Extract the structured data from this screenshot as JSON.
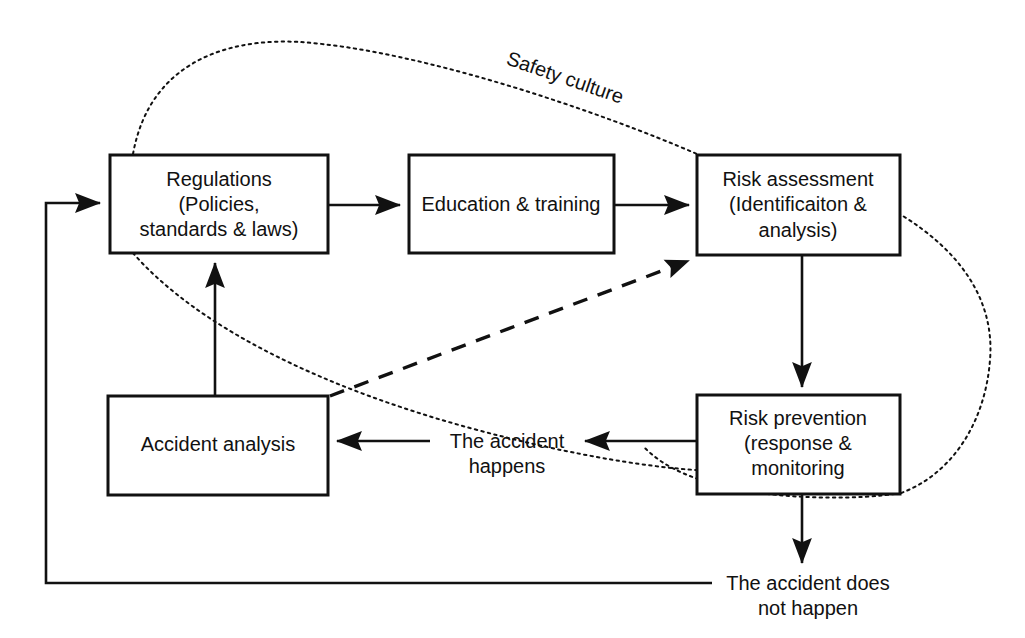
{
  "diagram": {
    "colors": {
      "stroke": "#111111",
      "background": "#ffffff"
    },
    "nodes": [
      {
        "id": "regulations",
        "lines": [
          "Regulations",
          "(Policies,",
          "standards & laws)"
        ]
      },
      {
        "id": "education",
        "lines": [
          "Education & training"
        ]
      },
      {
        "id": "risk-assessment",
        "lines": [
          "Risk assessment",
          "(Identificaiton &",
          "analysis)"
        ]
      },
      {
        "id": "risk-prevention",
        "lines": [
          "Risk prevention",
          "(response &",
          "monitoring"
        ]
      },
      {
        "id": "accident-analysis",
        "lines": [
          "Accident analysis"
        ]
      }
    ],
    "edge_labels": [
      {
        "id": "safety-culture",
        "text": "Safety culture"
      },
      {
        "id": "accident-happens",
        "lines": [
          "The accident",
          "happens"
        ]
      },
      {
        "id": "accident-not-happen",
        "lines": [
          "The accident does",
          "not happen"
        ]
      }
    ]
  }
}
